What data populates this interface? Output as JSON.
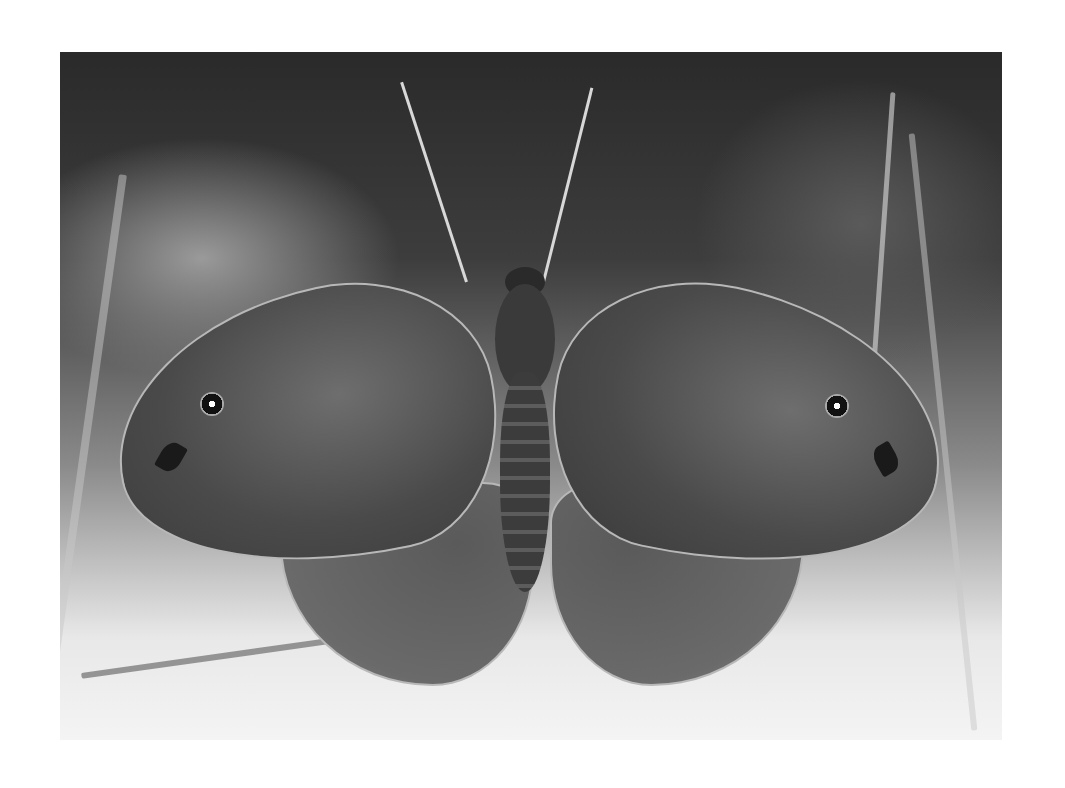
{
  "image": {
    "description": "Grayscale photograph of a Meadow Brown butterfly with wings spread open, resting on grasses",
    "subject": "butterfly",
    "palette": {
      "background": "#ffffff",
      "foliage_dark": "#2a2a2a",
      "wing": "#4a4a4a",
      "wing_edge": "#b8b8b8",
      "highlight": "#f4f4f4"
    }
  }
}
